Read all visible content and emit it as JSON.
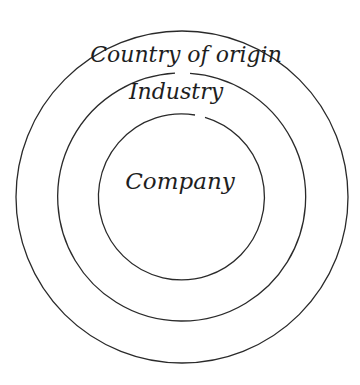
{
  "diagram": {
    "type": "concentric-circles",
    "stroke_color": "#2a2a2a",
    "background": "#ffffff",
    "center": {
      "x": 182,
      "y": 197
    },
    "rings": [
      {
        "name": "country-of-origin",
        "label": "Country of origin",
        "radius": 166,
        "level": "outer"
      },
      {
        "name": "industry",
        "label": "Industry",
        "radius": 124,
        "level": "middle"
      },
      {
        "name": "company",
        "label": "Company",
        "radius": 83,
        "level": "inner"
      }
    ]
  }
}
